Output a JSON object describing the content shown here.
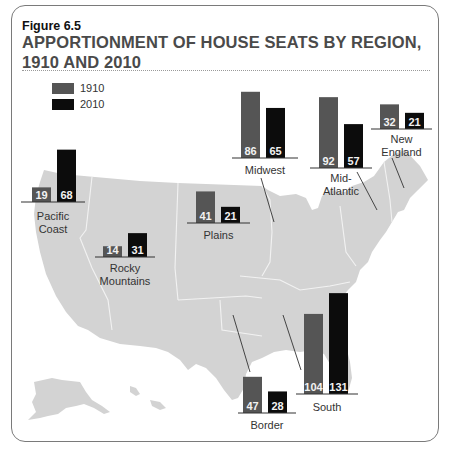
{
  "figure": {
    "number": "Figure 6.5",
    "title_line1": "APPORTIONMENT OF HOUSE SEATS BY REGION,",
    "title_line2": "1910 AND 2010"
  },
  "colors": {
    "series_1910": "#555555",
    "series_2010": "#0c0c0c",
    "map": "#d3d3d3"
  },
  "chart_data": {
    "type": "bar",
    "title": "Apportionment of House Seats by Region, 1910 and 2010",
    "xlabel": "",
    "ylabel": "House seats",
    "legend": {
      "placement": "top-left",
      "entries": [
        "1910",
        "2010"
      ]
    },
    "categories": [
      "Pacific Coast",
      "Rocky Mountains",
      "Plains",
      "Midwest",
      "Mid-Atlantic",
      "New England",
      "Border",
      "South"
    ],
    "series": [
      {
        "name": "1910",
        "values": [
          19,
          14,
          41,
          86,
          92,
          32,
          47,
          104
        ]
      },
      {
        "name": "2010",
        "values": [
          68,
          31,
          21,
          65,
          57,
          21,
          28,
          131
        ]
      }
    ],
    "region_labels": [
      [
        "Pacific",
        "Coast"
      ],
      [
        "Rocky",
        "Mountains"
      ],
      [
        "Plains"
      ],
      [
        "Midwest"
      ],
      [
        "Mid-",
        "Atlantic"
      ],
      [
        "New",
        "England"
      ],
      [
        "Border"
      ],
      [
        "South"
      ]
    ],
    "grid": false
  }
}
